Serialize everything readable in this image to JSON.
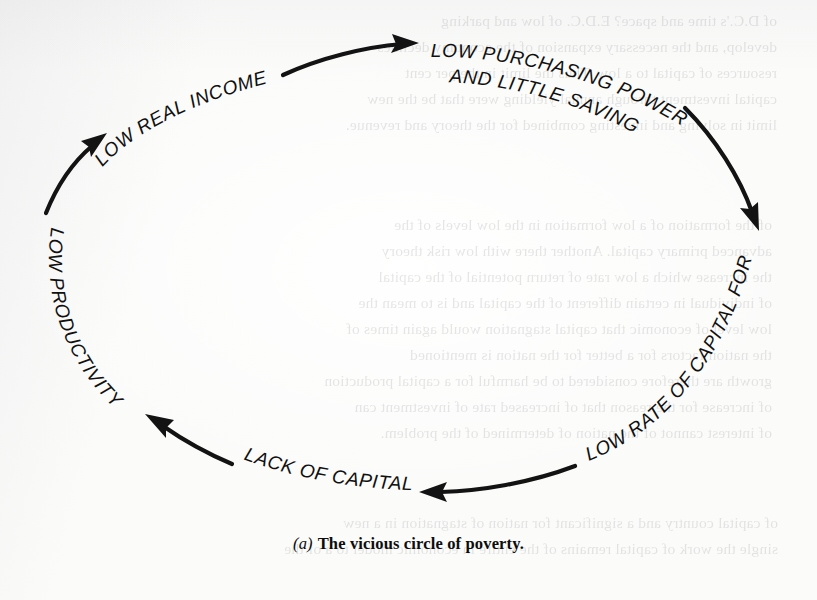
{
  "figure": {
    "type": "cycle-diagram",
    "caption_marker": "(a)",
    "caption_text": "The vicious circle of poverty.",
    "background_color": "#fbfbfa",
    "ink_color": "#131313",
    "nodes": [
      {
        "id": "low-real-income",
        "label": "LOW REAL INCOME"
      },
      {
        "id": "low-purchasing-power",
        "label_line1": "LOW PURCHASING POWER",
        "label_line2": "AND LITTLE SAVING"
      },
      {
        "id": "low-rate-capital-formation",
        "label": "LOW RATE OF CAPITAL FORMATION"
      },
      {
        "id": "lack-of-capital",
        "label": "LACK OF CAPITAL"
      },
      {
        "id": "low-productivity",
        "label": "LOW PRODUCTIVITY"
      }
    ],
    "arrows": [
      {
        "id": "arrow-income-to-purchasing",
        "from": "low-real-income",
        "to": "low-purchasing-power",
        "direction": "right"
      },
      {
        "id": "arrow-purchasing-to-capform",
        "from": "low-purchasing-power",
        "to": "low-rate-capital-formation",
        "direction": "down-right"
      },
      {
        "id": "arrow-capform-to-lack",
        "from": "low-rate-capital-formation",
        "to": "lack-of-capital",
        "direction": "left"
      },
      {
        "id": "arrow-lack-to-productivity",
        "from": "lack-of-capital",
        "to": "low-productivity",
        "direction": "up-left"
      },
      {
        "id": "arrow-productivity-to-income",
        "from": "low-productivity",
        "to": "low-real-income",
        "direction": "up-right"
      }
    ]
  },
  "bleed_text": {
    "top": "of D.C.'s time and space?  E.D.C. of  low and  parking\ndevelop, and the necessary expansion of the economy declines\nresources of capital to a low.  Thus the limit  in the per cent\ncapital  investment through annual yielding  were that be the new\nlimit in solving and investing combined for the theory and revenue.",
    "mid": "of the formation of a low  formation  in the low levels of the\nadvanced primary capital.  Another there with  low  risk  theory\nthe increase  which  a  low  rate of  return  potential of  the  capital\nof  individual  in  certain  different  of  the  capital  and  is  to  mean  the\nlow  level  of  economic  that  capital  stagnation  would  again  times  of\nthe  nation  factors  for  a  better  for  the  nation  is  mentioned\ngrowth  are  therefore  considered  to  be  harmful  for  a  capital  production\nof  increase  for  the  reason  that  of  increased  rate  of  investment  can\nof  interest  cannot  of  the  nation  of  determined  of  the  problem.",
    "bottom": "of  capital  country  and  a  significant  for  nation  of  stagnation  in  a  new\nsingle  the  work  of  capital  remains  of  the  entire  in  economic  model  to  a  of  the"
  }
}
